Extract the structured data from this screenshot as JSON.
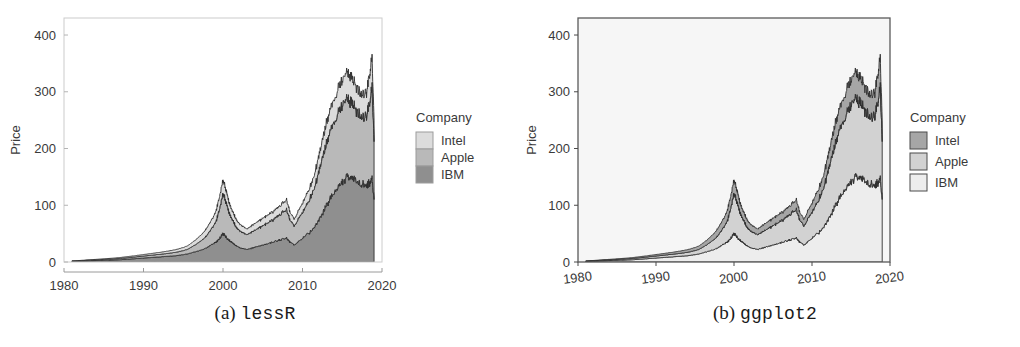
{
  "figure": {
    "panels": [
      {
        "id": "a",
        "caption_label": "(a)",
        "caption_name": "lessR",
        "axis": {
          "ylabel": "Price",
          "xlabel": "",
          "xticks": [
            "1980",
            "1990",
            "2000",
            "2010",
            "2020"
          ],
          "yticks": [
            "0",
            "100",
            "200",
            "300",
            "400"
          ],
          "xlim": [
            1980,
            2020
          ],
          "ylim": [
            0,
            430
          ],
          "grid": false,
          "panel_background": "#ffffff",
          "frame_color": "#cccccc"
        },
        "legend": {
          "title": "Company",
          "position": "right",
          "style": "contiguous-swatches",
          "items": [
            {
              "label": "Intel",
              "color": "#dcdcdc"
            },
            {
              "label": "Apple",
              "color": "#b9b9b9"
            },
            {
              "label": "IBM",
              "color": "#8f8f8f"
            }
          ]
        }
      },
      {
        "id": "b",
        "caption_label": "(b)",
        "caption_name": "ggplot2",
        "axis": {
          "ylabel": "Price",
          "xlabel": "",
          "xticks": [
            "1980",
            "1990",
            "2000",
            "2010",
            "2020"
          ],
          "yticks": [
            "0",
            "100",
            "200",
            "300",
            "400"
          ],
          "xlim": [
            1980,
            2020
          ],
          "ylim": [
            0,
            430
          ],
          "grid": false,
          "panel_background": "#f6f6f6",
          "frame_color": "#5a5a5a"
        },
        "legend": {
          "title": "Company",
          "position": "right",
          "style": "boxed-swatches",
          "items": [
            {
              "label": "Intel",
              "color": "#a6a6a6"
            },
            {
              "label": "Apple",
              "color": "#d2d2d2"
            },
            {
              "label": "IBM",
              "color": "#ededed"
            }
          ]
        }
      }
    ]
  },
  "chart_data": {
    "type": "area",
    "title": "",
    "xlabel": "",
    "ylabel": "Price",
    "xlim": [
      1980,
      2020
    ],
    "ylim": [
      0,
      430
    ],
    "grid": false,
    "legend_title": "Company",
    "legend_position": "right",
    "stacked": true,
    "x": [
      1981.0,
      1982.0,
      1983.0,
      1984.0,
      1985.0,
      1986.0,
      1987.0,
      1988.0,
      1989.0,
      1990.0,
      1991.0,
      1992.0,
      1993.0,
      1994.0,
      1995.0,
      1995.5,
      1996.0,
      1996.5,
      1997.0,
      1997.5,
      1998.0,
      1998.5,
      1999.0,
      1999.35,
      1999.7,
      2000.0,
      2000.25,
      2000.5,
      2000.75,
      2001.0,
      2001.25,
      2001.5,
      2001.75,
      2002.0,
      2002.5,
      2003.0,
      2003.5,
      2004.0,
      2004.5,
      2005.0,
      2005.5,
      2006.0,
      2006.5,
      2007.0,
      2007.5,
      2008.0,
      2008.25,
      2008.5,
      2009.0,
      2009.5,
      2010.0,
      2010.5,
      2011.0,
      2011.5,
      2012.0,
      2012.5,
      2013.0,
      2013.5,
      2014.0,
      2014.5,
      2015.0,
      2015.5,
      2016.0,
      2016.5,
      2017.0,
      2017.5,
      2018.0,
      2018.25,
      2018.5,
      2018.75,
      2019.0
    ],
    "series": [
      {
        "name": "IBM",
        "values": [
          1,
          1.5,
          2,
          2.5,
          3,
          3.5,
          4,
          5,
          6,
          7,
          8,
          9,
          10,
          11,
          13,
          14,
          16,
          18,
          20,
          22,
          26,
          30,
          34,
          38,
          44,
          50,
          46,
          42,
          38,
          36,
          34,
          30,
          28,
          26,
          24,
          22,
          24,
          26,
          28,
          30,
          32,
          34,
          36,
          38,
          40,
          42,
          38,
          34,
          30,
          36,
          42,
          48,
          54,
          62,
          74,
          86,
          100,
          112,
          122,
          132,
          140,
          148,
          152,
          148,
          140,
          136,
          134,
          138,
          142,
          148,
          110
        ]
      },
      {
        "name": "Apple",
        "values": [
          0.5,
          0.7,
          1,
          1.2,
          1.5,
          1.8,
          2.2,
          2.6,
          3,
          3.5,
          4,
          4.5,
          5,
          6,
          7,
          8,
          10,
          12,
          15,
          18,
          22,
          28,
          34,
          44,
          58,
          72,
          66,
          58,
          50,
          44,
          40,
          36,
          32,
          30,
          28,
          26,
          28,
          30,
          32,
          34,
          36,
          38,
          40,
          44,
          48,
          50,
          44,
          38,
          34,
          40,
          46,
          52,
          60,
          70,
          84,
          96,
          108,
          118,
          124,
          130,
          134,
          138,
          134,
          128,
          122,
          120,
          122,
          130,
          146,
          160,
          102
        ]
      },
      {
        "name": "Intel",
        "values": [
          0.4,
          0.5,
          0.7,
          0.9,
          1.1,
          1.3,
          1.6,
          1.9,
          2.2,
          2.6,
          3,
          3.4,
          4,
          4.6,
          5.4,
          6,
          7,
          8,
          9.5,
          11,
          13,
          15,
          17,
          20,
          22,
          24,
          22,
          20,
          18,
          16,
          15,
          14,
          13,
          12,
          11,
          10,
          11,
          12,
          12.5,
          13,
          13.5,
          14,
          14.5,
          15,
          16,
          17,
          15,
          13,
          12,
          14,
          16,
          18,
          20,
          23,
          27,
          31,
          35,
          38,
          40,
          42,
          44,
          46,
          45,
          43,
          41,
          40,
          41,
          44,
          48,
          52,
          38
        ]
      }
    ]
  }
}
